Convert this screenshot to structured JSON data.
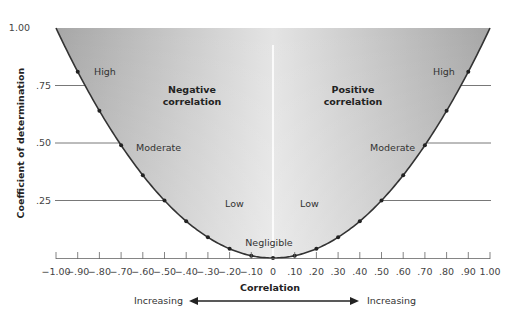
{
  "chart_data": {
    "type": "line",
    "title": "",
    "xlabel": "Correlation",
    "ylabel": "Coefficient of determination",
    "xlim": [
      -1.0,
      1.0
    ],
    "ylim": [
      0,
      1.0
    ],
    "grid": false,
    "x_tick_labels": [
      "-1.00",
      "-.90",
      "-.80",
      "-.70",
      "-.60",
      "-.50",
      "-.40",
      "-.30",
      "-.20",
      "-.10",
      "0",
      ".10",
      ".20",
      ".30",
      ".40",
      ".50",
      ".60",
      ".70",
      ".80",
      ".90",
      "1.00"
    ],
    "y_tick_labels": [
      "1.00",
      ".75",
      ".50",
      ".25"
    ],
    "series": [
      {
        "name": "r squared",
        "x": [
          -1.0,
          -0.9,
          -0.8,
          -0.7,
          -0.6,
          -0.5,
          -0.4,
          -0.3,
          -0.2,
          -0.1,
          0,
          0.1,
          0.2,
          0.3,
          0.4,
          0.5,
          0.6,
          0.7,
          0.8,
          0.9,
          1.0
        ],
        "values": [
          1.0,
          0.81,
          0.64,
          0.49,
          0.36,
          0.25,
          0.16,
          0.09,
          0.04,
          0.01,
          0,
          0.01,
          0.04,
          0.09,
          0.16,
          0.25,
          0.36,
          0.49,
          0.64,
          0.81,
          1.0
        ]
      }
    ],
    "annotations": {
      "left_region": "Negative correlation",
      "right_region": "Positive correlation",
      "strength_labels": [
        "High",
        "Moderate",
        "Low",
        "Negligible",
        "Low",
        "Moderate",
        "High"
      ],
      "direction_left": "Increasing",
      "direction_right": "Increasing"
    }
  },
  "labels": {
    "y_axis_title": "Coefficient of determination",
    "x_axis_title": "Correlation",
    "y_ticks": [
      "1.00",
      ".75",
      ".50",
      ".25"
    ],
    "x_ticks": [
      "−1.00",
      "−.90",
      "−.80",
      "−.70",
      "−.60",
      "−.50",
      "−.40",
      "−.30",
      "−.20",
      "−.10",
      "0",
      ".10",
      ".20",
      ".30",
      ".40",
      ".50",
      ".60",
      ".70",
      ".80",
      ".90",
      "1.00"
    ],
    "negative_line1": "Negative",
    "negative_line2": "correlation",
    "positive_line1": "Positive",
    "positive_line2": "correlation",
    "high_left": "High",
    "high_right": "High",
    "moderate_left": "Moderate",
    "moderate_right": "Moderate",
    "low_left": "Low",
    "low_right": "Low",
    "negligible": "Negligible",
    "increasing_left": "Increasing",
    "increasing_right": "Increasing"
  },
  "colors": {
    "fill_dark": "#a9a9a9",
    "fill_light": "#e6e6e6",
    "curve": "#333333",
    "gridline": "#555555"
  }
}
